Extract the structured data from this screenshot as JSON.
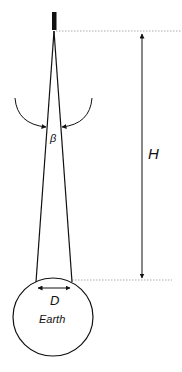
{
  "diagram": {
    "labels": {
      "height": "H",
      "angle": "β",
      "diameter": "D",
      "earth": "Earth"
    },
    "elements": {
      "satellite": "satellite-sensor",
      "cone": "field-of-view-cone",
      "angle_arc": "beta-angle-arc",
      "height_arrow": "height-dimension-arrow",
      "diameter_arrow": "footprint-diameter-arrow",
      "earth": "earth-circle"
    },
    "colors": {
      "line": "#111111",
      "guide": "#aaaaaa"
    }
  }
}
